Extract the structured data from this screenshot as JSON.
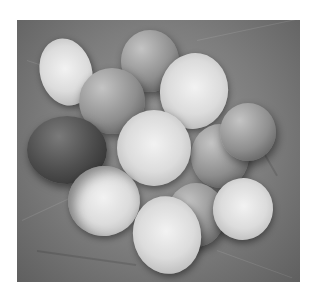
{
  "image": {
    "description": "Black-and-white photograph of broken eggshells arranged on crumpled paper",
    "alt": "Eggshells on crumpled paper",
    "tone": "grayscale",
    "colors": {
      "background": "#ffffff",
      "paper": "#8a8a8a",
      "shell_highlight": "#ededed",
      "shadow": "#2a2a2a"
    }
  }
}
